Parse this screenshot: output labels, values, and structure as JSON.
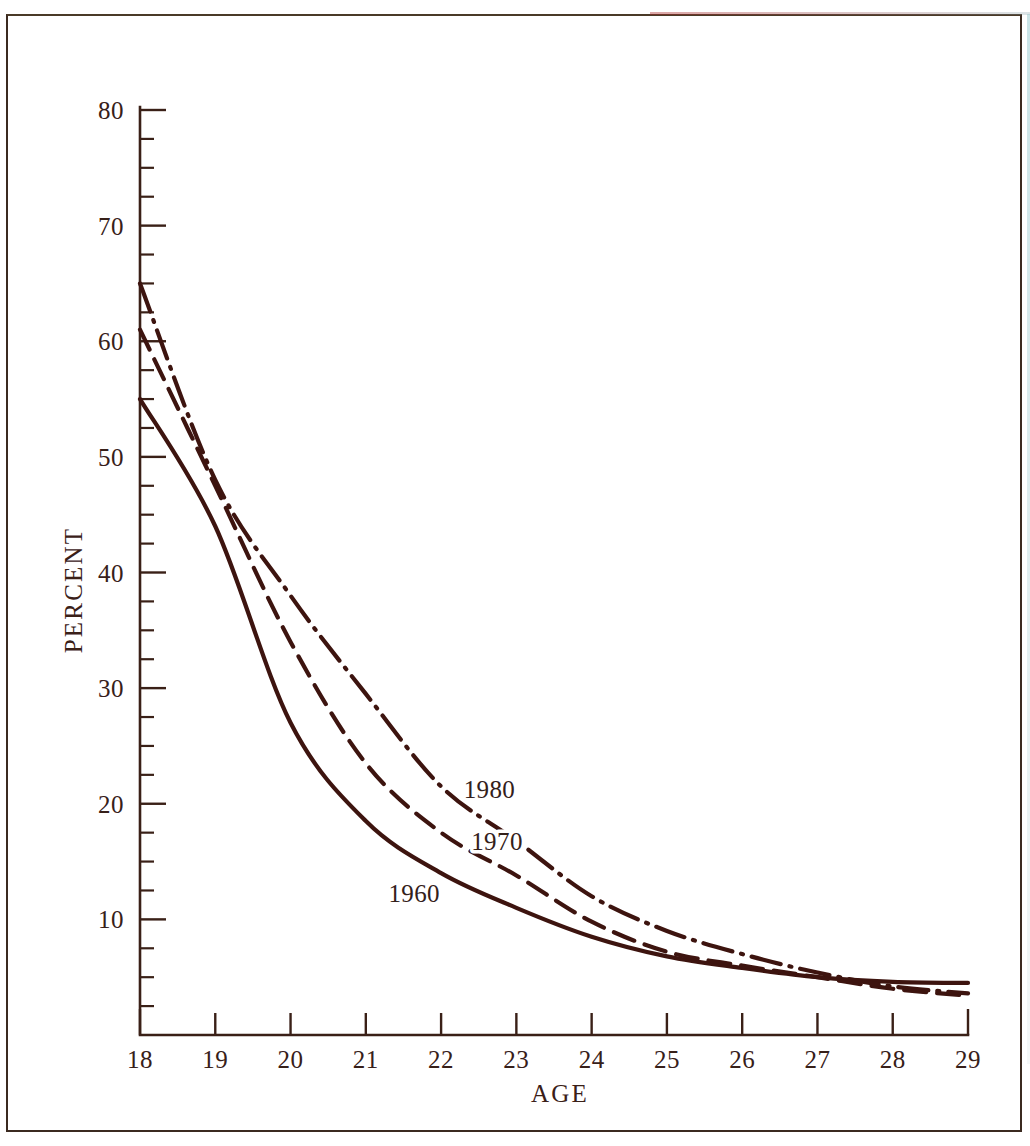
{
  "figure": {
    "ink_color": "#3d140f",
    "axis_color": "#3a2017",
    "background": "#ffffff",
    "frame_color": "#3b2a20"
  },
  "chart_data": {
    "type": "line",
    "title": "",
    "xlabel": "AGE",
    "ylabel": "PERCENT",
    "xlim": [
      18,
      29
    ],
    "ylim": [
      0,
      80
    ],
    "grid": false,
    "legend_position": "inline-labels",
    "x_ticks": [
      18,
      19,
      20,
      21,
      22,
      23,
      24,
      25,
      26,
      27,
      28,
      29
    ],
    "y_ticks": [
      10,
      20,
      30,
      40,
      50,
      60,
      70,
      80
    ],
    "y_minor_tick_step": 2.5,
    "x": [
      18,
      19,
      20,
      21,
      22,
      23,
      24,
      25,
      26,
      27,
      28,
      29
    ],
    "series": [
      {
        "name": "1960",
        "style": "solid",
        "label": "1960",
        "values": [
          55.0,
          44.0,
          27.0,
          18.5,
          14.0,
          11.0,
          8.5,
          6.8,
          5.8,
          5.0,
          4.6,
          4.5
        ]
      },
      {
        "name": "1970",
        "style": "dashed",
        "label": "1970",
        "values": [
          61.0,
          47.5,
          34.0,
          23.5,
          17.5,
          13.8,
          9.8,
          7.2,
          6.0,
          5.0,
          4.0,
          3.4
        ]
      },
      {
        "name": "1980",
        "style": "dash-dot",
        "label": "1980",
        "values": [
          65.0,
          48.0,
          38.0,
          29.5,
          21.5,
          16.8,
          12.0,
          9.0,
          7.0,
          5.4,
          4.2,
          3.6
        ]
      }
    ],
    "annotations": [
      {
        "text": "1980",
        "x": 22.3,
        "y": 20.5
      },
      {
        "text": "1970",
        "x": 22.4,
        "y": 16.0
      },
      {
        "text": "1960",
        "x": 21.3,
        "y": 11.5
      }
    ]
  },
  "axes": {
    "x_axis_title": "AGE",
    "y_axis_title": "PERCENT",
    "x_tick_labels": [
      "18",
      "19",
      "20",
      "21",
      "22",
      "23",
      "24",
      "25",
      "26",
      "27",
      "28",
      "29"
    ],
    "y_tick_labels": [
      "80",
      "70",
      "60",
      "50",
      "40",
      "30",
      "20",
      "10"
    ]
  }
}
